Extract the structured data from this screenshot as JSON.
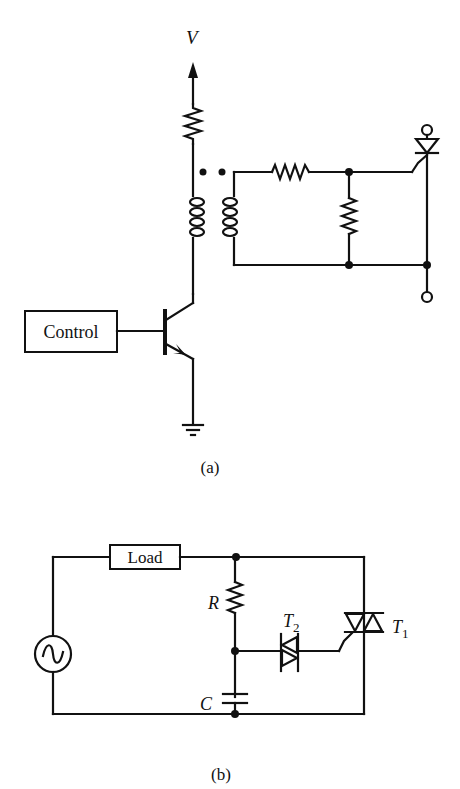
{
  "figure_a": {
    "caption": "(a)",
    "supply_label": "V",
    "control_label": "Control",
    "components": [
      "supply-arrow",
      "collector-resistor",
      "pulse-transformer-primary",
      "pulse-transformer-secondary",
      "series-resistor",
      "shunt-resistor",
      "npn-transistor",
      "ground",
      "scr",
      "anode-terminal",
      "cathode-terminal"
    ]
  },
  "figure_b": {
    "caption": "(b)",
    "load_label": "Load",
    "resistor_label": "R",
    "capacitor_label": "C",
    "diac_label": "T",
    "diac_subscript": "2",
    "triac_label": "T",
    "triac_subscript": "1",
    "components": [
      "ac-source",
      "load",
      "resistor-r",
      "capacitor-c",
      "diac-t2",
      "triac-t1"
    ]
  },
  "colors": {
    "ink": "#111111",
    "background": "#ffffff"
  }
}
